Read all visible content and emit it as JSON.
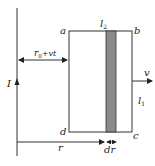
{
  "diagram": {
    "labels": {
      "current": "I",
      "corner_a": "a",
      "corner_b": "b",
      "corner_c": "c",
      "corner_d": "d",
      "top_length": "l",
      "top_length_sub": "2",
      "side_length": "l",
      "side_length_sub": "1",
      "velocity": "v",
      "distance": "r",
      "strip_width": "dr",
      "offset_r": "r",
      "offset_sub": "0",
      "offset_rest": "+vt"
    },
    "colors": {
      "line": "#333333",
      "strip_fill": "#8a8a8a",
      "background": "#ffffff"
    }
  }
}
